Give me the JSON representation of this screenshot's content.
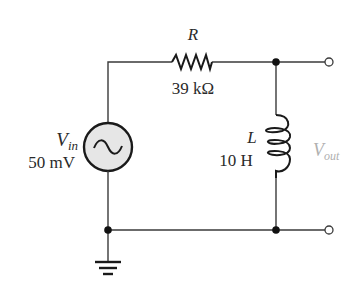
{
  "diagram": {
    "type": "circuit-schematic",
    "source": {
      "symbol": "V",
      "subscript": "in",
      "value": "50 mV",
      "kind": "ac-voltage-source"
    },
    "resistor": {
      "symbol": "R",
      "value": "39 kΩ"
    },
    "inductor": {
      "symbol": "L",
      "value": "10 H"
    },
    "output": {
      "symbol": "V",
      "subscript": "out"
    },
    "ground": "ground-symbol",
    "colors": {
      "wire": "#3a3a3a",
      "component": "#1a1a1a",
      "source_fill": "#e6e6e6",
      "output_label": "#b0b0b0",
      "label": "#2a2a2a"
    }
  }
}
